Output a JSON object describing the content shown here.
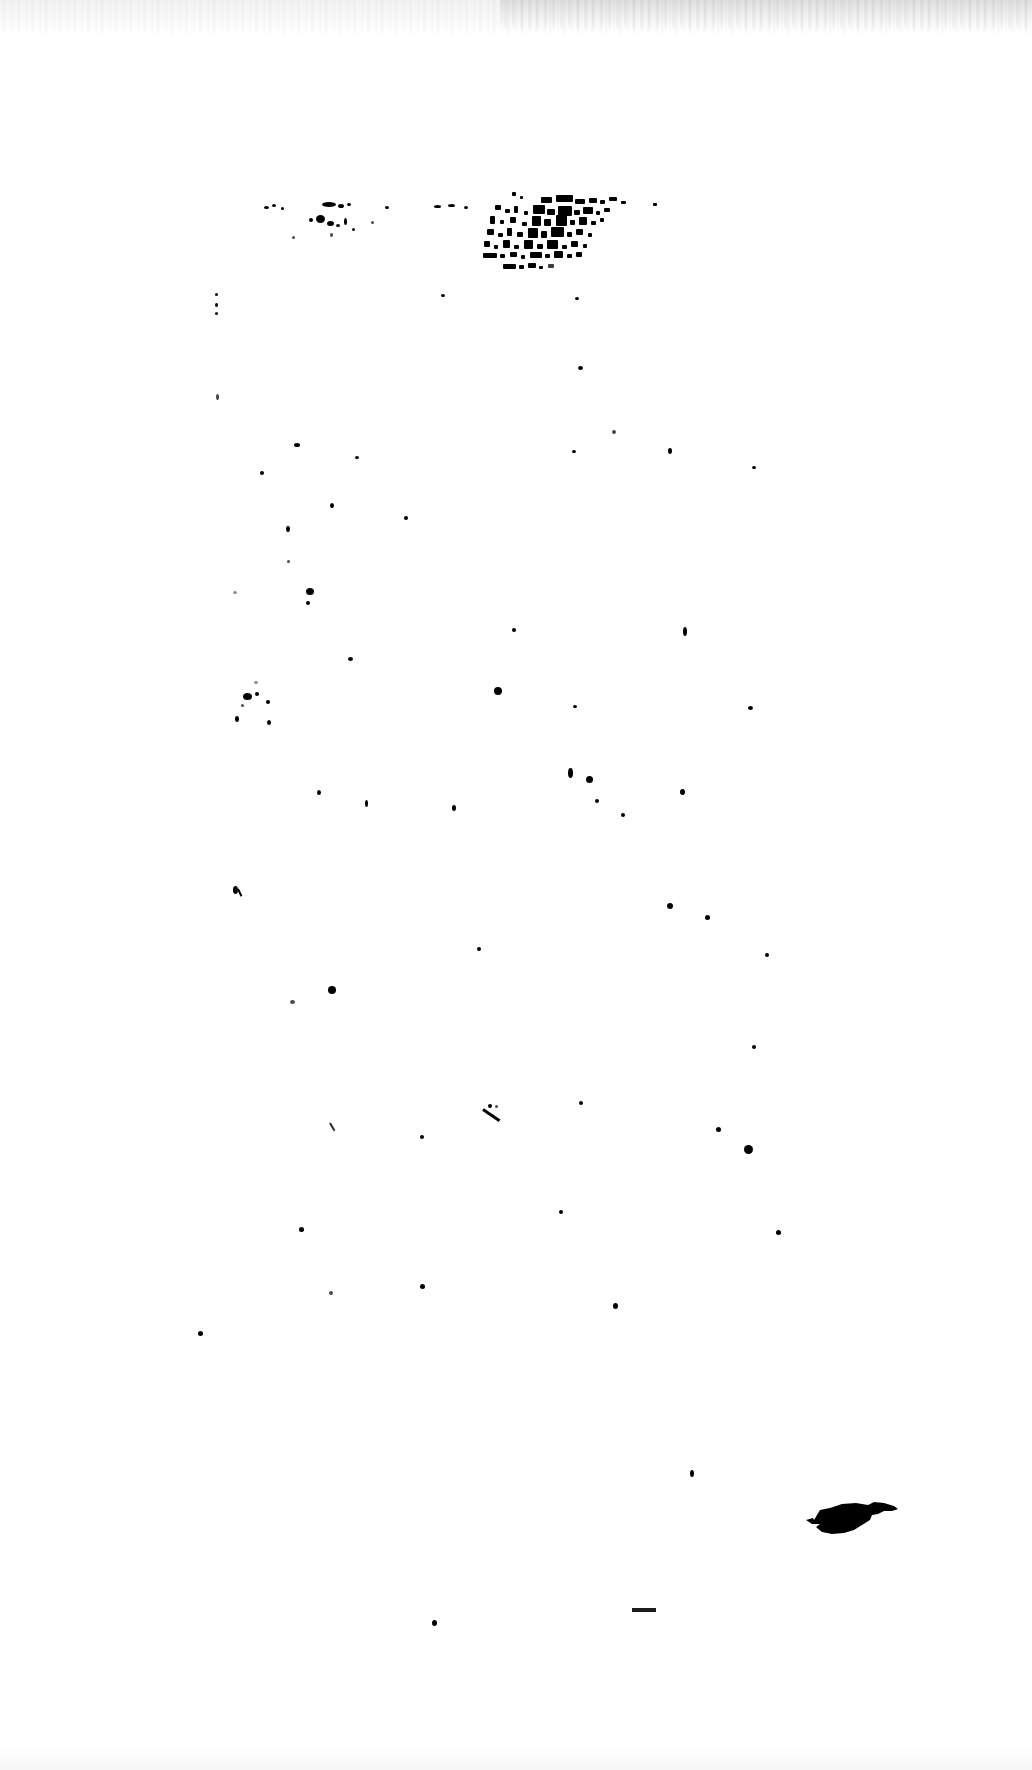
{
  "document": {
    "kind": "scanned-page",
    "legibility_note": "illegible",
    "page_background": "#ffffff",
    "ink_color": "#000000",
    "width_px": 1032,
    "height_px": 1770,
    "visible_text": "",
    "heading_text": "",
    "body_text": "",
    "page_number": "",
    "caption": ""
  },
  "artifacts": {
    "top_edge_streaking": "scan-streak",
    "text_cluster_label": "illegible-text-fragments",
    "large_blot_label": "ink-blot",
    "dash_label": "short-dash-mark",
    "stroke_label": "diagonal-pen-stroke"
  },
  "text_fragments": {
    "line_1": "",
    "line_2": "",
    "line_3": "",
    "line_4": ""
  },
  "specks": [
    {
      "x": 264,
      "y": 206,
      "w": 5,
      "h": 3,
      "tone": "solid"
    },
    {
      "x": 272,
      "y": 204,
      "w": 4,
      "h": 3,
      "tone": "solid"
    },
    {
      "x": 281,
      "y": 207,
      "w": 3,
      "h": 3,
      "tone": "solid"
    },
    {
      "x": 322,
      "y": 202,
      "w": 14,
      "h": 5,
      "tone": "solid"
    },
    {
      "x": 338,
      "y": 204,
      "w": 6,
      "h": 4,
      "tone": "solid"
    },
    {
      "x": 347,
      "y": 203,
      "w": 4,
      "h": 3,
      "tone": "solid"
    },
    {
      "x": 309,
      "y": 218,
      "w": 4,
      "h": 4,
      "tone": "solid"
    },
    {
      "x": 316,
      "y": 215,
      "w": 9,
      "h": 8,
      "tone": "solid"
    },
    {
      "x": 327,
      "y": 221,
      "w": 7,
      "h": 5,
      "tone": "solid"
    },
    {
      "x": 336,
      "y": 224,
      "w": 4,
      "h": 3,
      "tone": "solid"
    },
    {
      "x": 344,
      "y": 218,
      "w": 3,
      "h": 7,
      "tone": "solid"
    },
    {
      "x": 352,
      "y": 228,
      "w": 3,
      "h": 3,
      "tone": "solid"
    },
    {
      "x": 330,
      "y": 233,
      "w": 3,
      "h": 4,
      "tone": "faint"
    },
    {
      "x": 292,
      "y": 236,
      "w": 3,
      "h": 3,
      "tone": "faint"
    },
    {
      "x": 385,
      "y": 206,
      "w": 4,
      "h": 3,
      "tone": "solid"
    },
    {
      "x": 371,
      "y": 221,
      "w": 3,
      "h": 3,
      "tone": "faint"
    },
    {
      "x": 434,
      "y": 205,
      "w": 7,
      "h": 3,
      "tone": "solid"
    },
    {
      "x": 448,
      "y": 204,
      "w": 7,
      "h": 3,
      "tone": "solid"
    },
    {
      "x": 464,
      "y": 206,
      "w": 4,
      "h": 3,
      "tone": "solid"
    },
    {
      "x": 215,
      "y": 293,
      "w": 3,
      "h": 3,
      "tone": "solid"
    },
    {
      "x": 215,
      "y": 303,
      "w": 3,
      "h": 4,
      "tone": "solid"
    },
    {
      "x": 215,
      "y": 312,
      "w": 3,
      "h": 3,
      "tone": "solid"
    },
    {
      "x": 441,
      "y": 294,
      "w": 4,
      "h": 3,
      "tone": "solid"
    },
    {
      "x": 575,
      "y": 297,
      "w": 4,
      "h": 3,
      "tone": "solid"
    },
    {
      "x": 578,
      "y": 366,
      "w": 5,
      "h": 4,
      "tone": "solid"
    },
    {
      "x": 216,
      "y": 394,
      "w": 3,
      "h": 6,
      "tone": "faint"
    },
    {
      "x": 294,
      "y": 443,
      "w": 6,
      "h": 4,
      "tone": "solid"
    },
    {
      "x": 355,
      "y": 456,
      "w": 4,
      "h": 3,
      "tone": "solid"
    },
    {
      "x": 572,
      "y": 450,
      "w": 4,
      "h": 3,
      "tone": "solid"
    },
    {
      "x": 612,
      "y": 430,
      "w": 4,
      "h": 4,
      "tone": "faint"
    },
    {
      "x": 668,
      "y": 448,
      "w": 4,
      "h": 6,
      "tone": "solid"
    },
    {
      "x": 752,
      "y": 466,
      "w": 4,
      "h": 3,
      "tone": "solid"
    },
    {
      "x": 260,
      "y": 471,
      "w": 4,
      "h": 4,
      "tone": "solid"
    },
    {
      "x": 330,
      "y": 503,
      "w": 4,
      "h": 5,
      "tone": "solid"
    },
    {
      "x": 404,
      "y": 516,
      "w": 4,
      "h": 4,
      "tone": "solid"
    },
    {
      "x": 286,
      "y": 526,
      "w": 4,
      "h": 6,
      "tone": "solid"
    },
    {
      "x": 287,
      "y": 560,
      "w": 3,
      "h": 3,
      "tone": "faint"
    },
    {
      "x": 306,
      "y": 588,
      "w": 8,
      "h": 7,
      "tone": "solid"
    },
    {
      "x": 306,
      "y": 601,
      "w": 4,
      "h": 4,
      "tone": "solid"
    },
    {
      "x": 233,
      "y": 591,
      "w": 4,
      "h": 3,
      "tone": "vfaint"
    },
    {
      "x": 348,
      "y": 657,
      "w": 5,
      "h": 4,
      "tone": "solid"
    },
    {
      "x": 254,
      "y": 681,
      "w": 4,
      "h": 3,
      "tone": "vfaint"
    },
    {
      "x": 243,
      "y": 693,
      "w": 9,
      "h": 7,
      "tone": "solid"
    },
    {
      "x": 255,
      "y": 692,
      "w": 4,
      "h": 4,
      "tone": "solid"
    },
    {
      "x": 241,
      "y": 704,
      "w": 3,
      "h": 3,
      "tone": "faint"
    },
    {
      "x": 235,
      "y": 716,
      "w": 4,
      "h": 6,
      "tone": "solid"
    },
    {
      "x": 512,
      "y": 628,
      "w": 4,
      "h": 4,
      "tone": "solid"
    },
    {
      "x": 683,
      "y": 627,
      "w": 4,
      "h": 9,
      "tone": "solid"
    },
    {
      "x": 573,
      "y": 705,
      "w": 4,
      "h": 3,
      "tone": "solid"
    },
    {
      "x": 494,
      "y": 687,
      "w": 8,
      "h": 8,
      "tone": "solid"
    },
    {
      "x": 748,
      "y": 706,
      "w": 5,
      "h": 4,
      "tone": "solid"
    },
    {
      "x": 266,
      "y": 700,
      "w": 4,
      "h": 4,
      "tone": "solid"
    },
    {
      "x": 267,
      "y": 720,
      "w": 4,
      "h": 5,
      "tone": "solid"
    },
    {
      "x": 317,
      "y": 790,
      "w": 4,
      "h": 5,
      "tone": "solid"
    },
    {
      "x": 365,
      "y": 800,
      "w": 3,
      "h": 7,
      "tone": "solid"
    },
    {
      "x": 568,
      "y": 768,
      "w": 5,
      "h": 10,
      "tone": "solid"
    },
    {
      "x": 586,
      "y": 776,
      "w": 7,
      "h": 7,
      "tone": "solid"
    },
    {
      "x": 452,
      "y": 805,
      "w": 4,
      "h": 6,
      "tone": "solid"
    },
    {
      "x": 595,
      "y": 799,
      "w": 4,
      "h": 4,
      "tone": "solid"
    },
    {
      "x": 621,
      "y": 813,
      "w": 4,
      "h": 4,
      "tone": "solid"
    },
    {
      "x": 680,
      "y": 789,
      "w": 5,
      "h": 6,
      "tone": "solid"
    },
    {
      "x": 233,
      "y": 886,
      "w": 5,
      "h": 8,
      "tone": "solid"
    },
    {
      "x": 667,
      "y": 903,
      "w": 6,
      "h": 6,
      "tone": "solid"
    },
    {
      "x": 705,
      "y": 915,
      "w": 5,
      "h": 5,
      "tone": "solid"
    },
    {
      "x": 477,
      "y": 947,
      "w": 4,
      "h": 4,
      "tone": "solid"
    },
    {
      "x": 765,
      "y": 953,
      "w": 4,
      "h": 4,
      "tone": "solid"
    },
    {
      "x": 290,
      "y": 1000,
      "w": 5,
      "h": 4,
      "tone": "faint"
    },
    {
      "x": 328,
      "y": 986,
      "w": 8,
      "h": 8,
      "tone": "solid"
    },
    {
      "x": 752,
      "y": 1045,
      "w": 4,
      "h": 4,
      "tone": "solid"
    },
    {
      "x": 579,
      "y": 1101,
      "w": 4,
      "h": 4,
      "tone": "solid"
    },
    {
      "x": 716,
      "y": 1127,
      "w": 5,
      "h": 5,
      "tone": "solid"
    },
    {
      "x": 488,
      "y": 1104,
      "w": 4,
      "h": 4,
      "tone": "solid"
    },
    {
      "x": 495,
      "y": 1105,
      "w": 3,
      "h": 3,
      "tone": "faint"
    },
    {
      "x": 420,
      "y": 1135,
      "w": 4,
      "h": 4,
      "tone": "solid"
    },
    {
      "x": 744,
      "y": 1145,
      "w": 9,
      "h": 9,
      "tone": "solid"
    },
    {
      "x": 299,
      "y": 1227,
      "w": 5,
      "h": 5,
      "tone": "solid"
    },
    {
      "x": 559,
      "y": 1210,
      "w": 4,
      "h": 4,
      "tone": "solid"
    },
    {
      "x": 776,
      "y": 1230,
      "w": 5,
      "h": 5,
      "tone": "solid"
    },
    {
      "x": 420,
      "y": 1284,
      "w": 5,
      "h": 5,
      "tone": "solid"
    },
    {
      "x": 329,
      "y": 1291,
      "w": 4,
      "h": 4,
      "tone": "faint"
    },
    {
      "x": 613,
      "y": 1303,
      "w": 5,
      "h": 6,
      "tone": "solid"
    },
    {
      "x": 198,
      "y": 1331,
      "w": 5,
      "h": 5,
      "tone": "solid"
    },
    {
      "x": 690,
      "y": 1470,
      "w": 4,
      "h": 7,
      "tone": "solid"
    },
    {
      "x": 432,
      "y": 1620,
      "w": 5,
      "h": 6,
      "tone": "solid"
    }
  ]
}
